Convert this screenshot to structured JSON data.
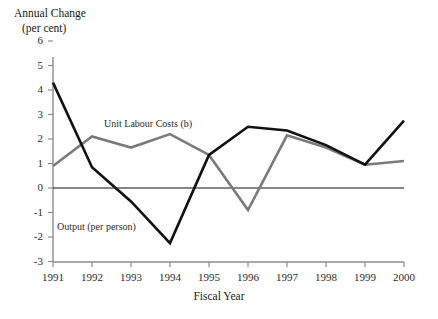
{
  "chart_data": {
    "type": "line",
    "title": "",
    "ylabel_line1": "Annual Change",
    "ylabel_line2": "(per cent)",
    "xlabel": "Fiscal Year",
    "categories": [
      "1991",
      "1992",
      "1993",
      "1994",
      "1995",
      "1996",
      "1997",
      "1998",
      "1999",
      "2000"
    ],
    "x": [
      1991,
      1992,
      1993,
      1994,
      1995,
      1996,
      1997,
      1998,
      1999,
      2000
    ],
    "ylim": [
      -3,
      6
    ],
    "yticks": [
      6,
      5,
      4,
      3,
      2,
      1,
      0,
      -1,
      -2,
      -3
    ],
    "ytick_labels": [
      "6",
      "5",
      "4",
      "3",
      "2",
      "1",
      "0",
      "-1",
      "-2",
      "-3"
    ],
    "grid": false,
    "legend": "inline-annotations",
    "zero_line": true,
    "series": [
      {
        "name": "Output (per person)",
        "color": "#111111",
        "width": 2.6,
        "values": [
          4.3,
          0.85,
          -0.55,
          -2.25,
          1.35,
          2.5,
          2.35,
          1.75,
          0.95,
          2.75
        ]
      },
      {
        "name": "Unit Labour Costs (b)",
        "color": "#7a7a7a",
        "width": 2.6,
        "values": [
          0.9,
          2.1,
          1.65,
          2.2,
          1.35,
          -0.9,
          2.15,
          1.65,
          0.95,
          1.1
        ]
      }
    ],
    "annotations": [
      {
        "text": "Unit Labour Costs (b)",
        "x": 1992.3,
        "y": 2.9
      },
      {
        "text": "Output (per person)",
        "x": 1991.1,
        "y": -1.35
      }
    ]
  },
  "axis_colors": {
    "axis": "#8c8c8c",
    "zero_line": "#111111",
    "tick_text": "#2b2b2b"
  }
}
